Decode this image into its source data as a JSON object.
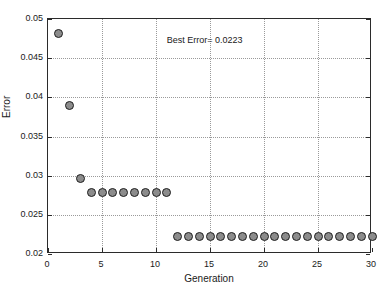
{
  "chart_data": {
    "type": "scatter",
    "title": "",
    "xlabel": "Generation",
    "ylabel": "Error",
    "xlim": [
      0,
      30
    ],
    "ylim": [
      0.02,
      0.05
    ],
    "xticks": [
      0,
      5,
      10,
      15,
      20,
      25,
      30
    ],
    "xtick_labels": [
      "0",
      "5",
      "10",
      "15",
      "20",
      "25",
      "30"
    ],
    "yticks": [
      0.02,
      0.025,
      0.03,
      0.035,
      0.04,
      0.045,
      0.05
    ],
    "ytick_labels": [
      "0.02",
      "0.025",
      "0.03",
      "0.035",
      "0.04",
      "0.045",
      "0.05"
    ],
    "grid": true,
    "legend": "none",
    "annotations": [
      {
        "text": "Best Error= 0.0223",
        "x": 14.5,
        "y": 0.0473
      }
    ],
    "marker_style": {
      "shape": "circle",
      "fill": "#8c8c8c",
      "edge": "#1f1f1f",
      "size": 9
    },
    "series": [
      {
        "name": "Best Error per Generation",
        "x": [
          1,
          2,
          3,
          4,
          5,
          6,
          7,
          8,
          9,
          10,
          11,
          12,
          13,
          14,
          15,
          16,
          17,
          18,
          19,
          20,
          21,
          22,
          23,
          24,
          25,
          26,
          27,
          28,
          29,
          30
        ],
        "values": [
          0.0482,
          0.039,
          0.0297,
          0.0278,
          0.0278,
          0.0278,
          0.0278,
          0.0278,
          0.0278,
          0.0278,
          0.0278,
          0.0222,
          0.0222,
          0.0222,
          0.0222,
          0.0222,
          0.0222,
          0.0222,
          0.0222,
          0.0222,
          0.0222,
          0.0222,
          0.0222,
          0.0222,
          0.0222,
          0.0222,
          0.0222,
          0.0222,
          0.0222,
          0.0222
        ]
      }
    ]
  },
  "figure": {
    "background_color": "#ffffff",
    "axis_color": "#2b2b2b",
    "grid_color": "#9a9a9a"
  }
}
